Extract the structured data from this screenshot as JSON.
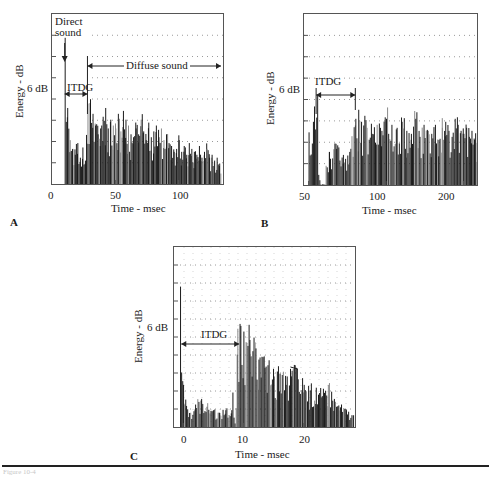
{
  "figure": {
    "panels": [
      {
        "letter": "A",
        "ylabel": "Energy - dB",
        "xlabel": "Time - msec",
        "scale_label": "6 dB",
        "xticks": [
          "0",
          "50",
          "100"
        ],
        "annotations": {
          "direct": "Direct\nsound",
          "direct_line1": "Direct",
          "direct_line2": "sound",
          "itdg": "ITDG",
          "diffuse": "Diffuse sound"
        }
      },
      {
        "letter": "B",
        "ylabel": "Energy - dB",
        "xlabel": "Time - msec",
        "scale_label": "6 dB",
        "xticks": [
          "50",
          "100",
          "200"
        ],
        "annotations": {
          "itdg": "ITDG"
        }
      },
      {
        "letter": "C",
        "ylabel": "Energy - dB",
        "xlabel": "Time - msec",
        "scale_label": "6 dB",
        "xticks": [
          "0",
          "10",
          "20"
        ],
        "annotations": {
          "itdg": "ITDG"
        }
      }
    ],
    "caption_faint": "Figure 10-4"
  },
  "colors": {
    "bars": "#1c1c1c",
    "frame": "#555555",
    "grid": "#9a9a9a"
  },
  "chart_data": [
    {
      "type": "bar",
      "title": "A",
      "xlabel": "Time - msec",
      "ylabel": "Energy - dB",
      "xlim": [
        0,
        135
      ],
      "xticks": [
        0,
        50,
        100
      ],
      "y_scale_marker": "6 dB",
      "series": [
        {
          "name": "energy-time response",
          "x": [
            10,
            12,
            14,
            16,
            18,
            20,
            22,
            24,
            26,
            28,
            30,
            32,
            34,
            36,
            38,
            40,
            42,
            44,
            46,
            48,
            50,
            52,
            54,
            56,
            58,
            60,
            62,
            64,
            66,
            68,
            70,
            72,
            74,
            76,
            78,
            80,
            82,
            84,
            86,
            88,
            90,
            92,
            94,
            96,
            98,
            100,
            102,
            104,
            106,
            108,
            110,
            112,
            114,
            116,
            118,
            120,
            122,
            124,
            126,
            128,
            130,
            132
          ],
          "values": [
            100,
            52,
            30,
            24,
            20,
            28,
            18,
            25,
            16,
            55,
            58,
            48,
            40,
            34,
            38,
            46,
            52,
            38,
            44,
            40,
            38,
            48,
            36,
            50,
            44,
            40,
            34,
            32,
            38,
            34,
            44,
            36,
            30,
            42,
            32,
            36,
            40,
            32,
            38,
            30,
            34,
            28,
            26,
            22,
            24,
            30,
            22,
            26,
            20,
            28,
            24,
            22,
            20,
            26,
            18,
            22,
            24,
            18,
            20,
            16,
            18,
            14
          ]
        }
      ],
      "annotations": [
        "Direct sound (~10 ms)",
        "ITDG (10–28 ms)",
        "Diffuse sound (28 ms →)"
      ]
    },
    {
      "type": "bar",
      "title": "B",
      "xlabel": "Time - msec",
      "ylabel": "Energy - dB",
      "xlim": [
        48,
        230
      ],
      "xticks": [
        50,
        100,
        200
      ],
      "y_scale_marker": "6 dB",
      "series": [
        {
          "name": "energy-time response",
          "x": [
            50,
            52,
            54,
            56,
            60,
            64,
            68,
            72,
            76,
            78,
            80,
            84,
            88,
            92,
            96,
            100,
            105,
            110,
            115,
            120,
            125,
            130,
            135,
            140,
            145,
            150,
            155,
            160,
            165,
            170,
            175,
            180,
            185,
            190,
            195,
            200,
            205,
            210,
            215,
            220,
            225
          ],
          "values": [
            35,
            42,
            60,
            0,
            22,
            24,
            20,
            22,
            44,
            50,
            42,
            38,
            34,
            40,
            36,
            44,
            40,
            38,
            42,
            36,
            34,
            44,
            32,
            40,
            36,
            34,
            40,
            30,
            38,
            42,
            36,
            32,
            44,
            40,
            36,
            34,
            38,
            32,
            36,
            30,
            28
          ]
        }
      ],
      "annotations": [
        "ITDG (52–76 ms)"
      ]
    },
    {
      "type": "bar",
      "title": "C",
      "xlabel": "Time - msec",
      "ylabel": "Energy - dB",
      "xlim": [
        -1.5,
        28.5
      ],
      "xticks": [
        0,
        10,
        20
      ],
      "y_scale_marker": "6 dB",
      "series": [
        {
          "name": "energy-time response",
          "x": [
            -0.5,
            0,
            0.5,
            1,
            2,
            3,
            4,
            5,
            6,
            7,
            8,
            9,
            9.5,
            10,
            10.5,
            11,
            11.5,
            12,
            12.5,
            13,
            13.5,
            14,
            15,
            16,
            17,
            18,
            18.5,
            19,
            20,
            21,
            22,
            23,
            24,
            25,
            26,
            27,
            28
          ],
          "values": [
            100,
            30,
            15,
            10,
            16,
            20,
            17,
            12,
            10,
            12,
            12,
            70,
            72,
            68,
            60,
            62,
            54,
            56,
            48,
            50,
            42,
            44,
            36,
            38,
            30,
            40,
            44,
            34,
            30,
            26,
            28,
            22,
            30,
            20,
            14,
            12,
            8
          ]
        }
      ],
      "annotations": [
        "ITDG (0–9.5 ms)"
      ]
    }
  ]
}
